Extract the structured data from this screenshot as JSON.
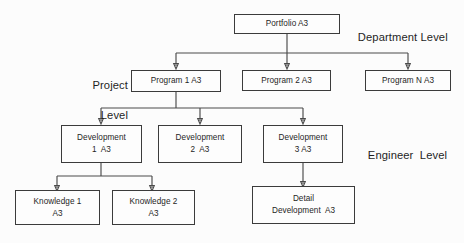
{
  "diagram": {
    "background_color": "#fcfcfc",
    "box_border_color": "#3b3b3b",
    "connector_color": "#4a4a4a"
  },
  "level_labels": {
    "department": "Department Level",
    "project_line1": "Project",
    "project_line2": "Level",
    "engineer": "Engineer  Level"
  },
  "nodes": {
    "portfolio": {
      "line1": "Portfolio A3",
      "line2": ""
    },
    "program1": {
      "line1": "Program 1 A3",
      "line2": ""
    },
    "program2": {
      "line1": "Program 2 A3",
      "line2": ""
    },
    "programN": {
      "line1": "Program N A3",
      "line2": ""
    },
    "development1": {
      "line1": "Development",
      "line2": "1  A3"
    },
    "development2": {
      "line1": "Development",
      "line2": "2  A3"
    },
    "development3": {
      "line1": "Development",
      "line2": "3 A3"
    },
    "knowledge1": {
      "line1": "Knowledge 1",
      "line2": "A3"
    },
    "knowledge2": {
      "line1": "Knowledge 2",
      "line2": "A3"
    },
    "detail_development": {
      "line1": "Detail",
      "line2": "Development  A3"
    }
  }
}
